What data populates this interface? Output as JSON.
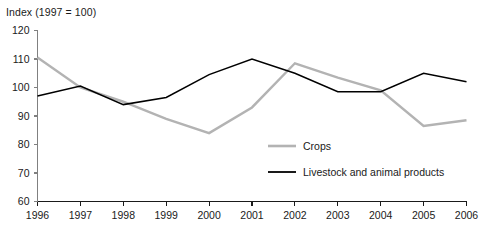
{
  "chart_data": {
    "type": "line",
    "title": "Index (1997 = 100)",
    "xlabel": "",
    "ylabel": "",
    "ylim": [
      60,
      120
    ],
    "ytick_values": [
      60,
      70,
      80,
      90,
      100,
      110,
      120
    ],
    "ytick_labels": [
      "60",
      "70",
      "80",
      "90",
      "100",
      "110",
      "120"
    ],
    "grid": false,
    "legend_position": "center-right-inside",
    "categories": [
      1996,
      1997,
      1998,
      1999,
      2000,
      2001,
      2002,
      2003,
      2004,
      2005,
      2006
    ],
    "xtick_labels": [
      "1996",
      "1997",
      "1998",
      "1999",
      "2000",
      "2001",
      "2002",
      "2003",
      "2004",
      "2005",
      "2006"
    ],
    "series": [
      {
        "name": "Crops",
        "color": "#b3b3b3",
        "values": [
          110.5,
          100.0,
          95.0,
          89.0,
          84.0,
          93.0,
          108.5,
          103.5,
          99.0,
          86.5,
          88.5
        ]
      },
      {
        "name": "Livestock and animal products",
        "color": "#000000",
        "values": [
          97.0,
          100.5,
          94.0,
          96.5,
          104.5,
          110.0,
          105.0,
          98.5,
          98.5,
          105.0,
          102.0
        ]
      }
    ]
  },
  "legend": {
    "items": [
      {
        "label": "Crops",
        "color": "#b3b3b3"
      },
      {
        "label": "Livestock and animal products",
        "color": "#000000"
      }
    ]
  }
}
